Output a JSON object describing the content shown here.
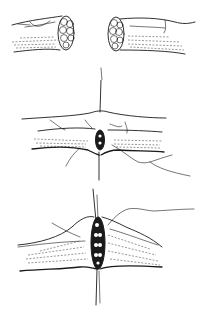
{
  "figure": {
    "panels": [
      {
        "id": "panel-1",
        "label": "",
        "content": "Two severed nerve stumps showing fascicles"
      },
      {
        "id": "panel-2",
        "label": "",
        "content": "Epineurial stay sutures placed, stumps approximated"
      },
      {
        "id": "panel-3",
        "label": "",
        "content": "Stumps coapted with sutures, fascicles aligned"
      }
    ],
    "colors": {
      "ink": "#1a1a1a",
      "background": "#ffffff"
    }
  }
}
